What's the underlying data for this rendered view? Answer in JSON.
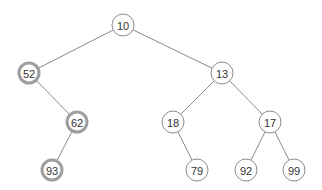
{
  "diagram": {
    "type": "binary-tree",
    "colors": {
      "edge": "#8a8a8a",
      "node_border": "#8c8c8c",
      "highlight_border": "#9e9e9e",
      "text": "#333333",
      "background": "#ffffff"
    },
    "nodes": [
      {
        "id": "n10",
        "label": "10",
        "x": 123,
        "y": 25,
        "highlighted": false
      },
      {
        "id": "n52",
        "label": "52",
        "x": 29,
        "y": 73,
        "highlighted": true
      },
      {
        "id": "n13",
        "label": "13",
        "x": 222,
        "y": 73,
        "highlighted": false
      },
      {
        "id": "n62",
        "label": "62",
        "x": 77,
        "y": 122,
        "highlighted": true
      },
      {
        "id": "n18",
        "label": "18",
        "x": 173,
        "y": 122,
        "highlighted": false
      },
      {
        "id": "n17",
        "label": "17",
        "x": 270,
        "y": 122,
        "highlighted": false
      },
      {
        "id": "n93",
        "label": "93",
        "x": 52,
        "y": 170,
        "highlighted": true
      },
      {
        "id": "n79",
        "label": "79",
        "x": 197,
        "y": 170,
        "highlighted": false
      },
      {
        "id": "n92",
        "label": "92",
        "x": 246,
        "y": 170,
        "highlighted": false
      },
      {
        "id": "n99",
        "label": "99",
        "x": 294,
        "y": 170,
        "highlighted": false
      }
    ],
    "edges": [
      {
        "from": "n10",
        "to": "n52"
      },
      {
        "from": "n10",
        "to": "n13"
      },
      {
        "from": "n52",
        "to": "n62"
      },
      {
        "from": "n62",
        "to": "n93"
      },
      {
        "from": "n13",
        "to": "n18"
      },
      {
        "from": "n13",
        "to": "n17"
      },
      {
        "from": "n18",
        "to": "n79"
      },
      {
        "from": "n17",
        "to": "n92"
      },
      {
        "from": "n17",
        "to": "n99"
      }
    ],
    "node_radius": 11
  }
}
